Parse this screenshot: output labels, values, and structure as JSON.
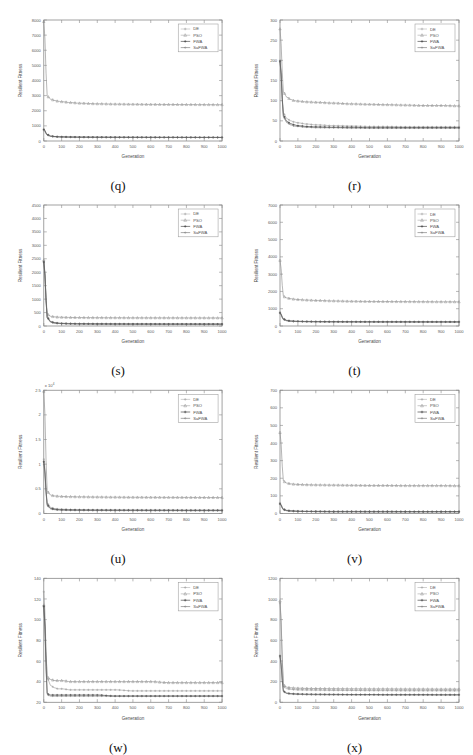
{
  "page": {
    "faint_header_text": "",
    "background": "#ffffff",
    "panel_count": 8
  },
  "common": {
    "xlabel": "Generation",
    "ylabel": "Resilient Fitness",
    "xticks": [
      0,
      100,
      200,
      300,
      400,
      500,
      600,
      700,
      800,
      900,
      1000
    ],
    "xlim": [
      0,
      1000
    ],
    "legend_position": "top-right",
    "legend_entries": [
      {
        "label": "DE",
        "marker": "plus",
        "color": "#9a9a9a"
      },
      {
        "label": "PSO",
        "marker": "triangle",
        "color": "#8e8e8e"
      },
      {
        "label": "FWA",
        "marker": "plus",
        "color": "#3a3a3a"
      },
      {
        "label": "SaFWA",
        "marker": "dot",
        "color": "#707070"
      }
    ],
    "series_names": [
      "DE",
      "PSO",
      "FWA",
      "SaFWA"
    ]
  },
  "chart_data": [
    {
      "id": "q",
      "caption": "(q)",
      "type": "line",
      "title": "",
      "xlabel": "Generation",
      "ylabel": "Resilient Fitness",
      "xlim": [
        0,
        1000
      ],
      "ylim": [
        0,
        8000
      ],
      "yticks": [
        0,
        1000,
        2000,
        3000,
        4000,
        5000,
        6000,
        7000,
        8000
      ],
      "ytick_labels": [
        "0",
        "1000",
        "2000",
        "3000",
        "4000",
        "5000",
        "6000",
        "7000",
        "8000"
      ],
      "y_exponent": "",
      "grid": false,
      "x": [
        0,
        20,
        40,
        60,
        80,
        100,
        150,
        200,
        300,
        400,
        500,
        600,
        700,
        800,
        900,
        1000
      ],
      "series": [
        {
          "name": "DE",
          "values": [
            780,
            430,
            330,
            300,
            285,
            275,
            265,
            258,
            252,
            248,
            245,
            243,
            241,
            240,
            239,
            238
          ]
        },
        {
          "name": "PSO",
          "values": [
            7900,
            2950,
            2760,
            2680,
            2630,
            2600,
            2540,
            2500,
            2460,
            2440,
            2430,
            2420,
            2415,
            2410,
            2405,
            2400
          ]
        },
        {
          "name": "FWA",
          "values": [
            760,
            410,
            320,
            295,
            282,
            272,
            262,
            256,
            250,
            246,
            244,
            242,
            240,
            239,
            238,
            237
          ]
        },
        {
          "name": "SaFWA",
          "values": [
            700,
            380,
            300,
            280,
            268,
            260,
            252,
            246,
            241,
            238,
            236,
            234,
            233,
            232,
            231,
            230
          ]
        }
      ]
    },
    {
      "id": "r",
      "caption": "(r)",
      "type": "line",
      "title": "",
      "xlabel": "Generation",
      "ylabel": "Resilient Fitness",
      "xlim": [
        0,
        1000
      ],
      "ylim": [
        0,
        300
      ],
      "yticks": [
        0,
        50,
        100,
        150,
        200,
        250,
        300
      ],
      "ytick_labels": [
        "0",
        "50",
        "100",
        "150",
        "200",
        "250",
        "300"
      ],
      "y_exponent": "",
      "grid": false,
      "x": [
        0,
        20,
        40,
        60,
        80,
        100,
        150,
        200,
        300,
        400,
        500,
        600,
        700,
        800,
        900,
        1000
      ],
      "series": [
        {
          "name": "DE",
          "values": [
            200,
            68,
            55,
            50,
            47,
            45,
            42,
            40,
            38,
            37,
            36,
            36,
            35,
            35,
            35,
            35
          ]
        },
        {
          "name": "PSO",
          "values": [
            278,
            120,
            108,
            103,
            100,
            99,
            97,
            96,
            94,
            92,
            91,
            90,
            89,
            88,
            88,
            87
          ]
        },
        {
          "name": "FWA",
          "values": [
            198,
            62,
            48,
            43,
            40,
            38,
            36,
            35,
            34,
            34,
            33,
            33,
            33,
            33,
            33,
            33
          ]
        },
        {
          "name": "SaFWA",
          "values": [
            196,
            58,
            45,
            40,
            37,
            36,
            34,
            33,
            33,
            32,
            32,
            32,
            32,
            32,
            32,
            32
          ]
        }
      ]
    },
    {
      "id": "s",
      "caption": "(s)",
      "type": "line",
      "title": "",
      "xlabel": "Generation",
      "ylabel": "Resilient Fitness",
      "xlim": [
        0,
        1000
      ],
      "ylim": [
        0,
        4500
      ],
      "yticks": [
        0,
        500,
        1000,
        1500,
        2000,
        2500,
        3000,
        3500,
        4000,
        4500
      ],
      "ytick_labels": [
        "0",
        "500",
        "1000",
        "1500",
        "2000",
        "2500",
        "3000",
        "3500",
        "4000",
        "4500"
      ],
      "y_exponent": "",
      "grid": false,
      "x": [
        0,
        20,
        40,
        60,
        80,
        100,
        150,
        200,
        300,
        400,
        500,
        600,
        700,
        800,
        900,
        1000
      ],
      "series": [
        {
          "name": "DE",
          "values": [
            2400,
            330,
            170,
            130,
            115,
            105,
            95,
            90,
            85,
            82,
            80,
            79,
            78,
            77,
            76,
            75
          ]
        },
        {
          "name": "PSO",
          "values": [
            2450,
            430,
            360,
            340,
            330,
            325,
            318,
            314,
            310,
            307,
            305,
            304,
            303,
            302,
            301,
            300
          ]
        },
        {
          "name": "FWA",
          "values": [
            2380,
            300,
            150,
            115,
            100,
            92,
            84,
            80,
            76,
            74,
            72,
            71,
            70,
            70,
            69,
            69
          ]
        },
        {
          "name": "SaFWA",
          "values": [
            2350,
            280,
            140,
            108,
            94,
            87,
            79,
            75,
            72,
            70,
            68,
            68,
            67,
            67,
            66,
            66
          ]
        }
      ]
    },
    {
      "id": "t",
      "caption": "(t)",
      "type": "line",
      "title": "",
      "xlabel": "Generation",
      "ylabel": "Resilient Fitness",
      "xlim": [
        0,
        1000
      ],
      "ylim": [
        0,
        7000
      ],
      "yticks": [
        0,
        1000,
        2000,
        3000,
        4000,
        5000,
        6000,
        7000
      ],
      "ytick_labels": [
        "0",
        "1000",
        "2000",
        "3000",
        "4000",
        "5000",
        "6000",
        "7000"
      ],
      "y_exponent": "",
      "grid": false,
      "x": [
        0,
        20,
        40,
        60,
        80,
        100,
        150,
        200,
        300,
        400,
        500,
        600,
        700,
        800,
        900,
        1000
      ],
      "series": [
        {
          "name": "DE",
          "values": [
            800,
            420,
            330,
            300,
            285,
            278,
            268,
            262,
            256,
            252,
            250,
            248,
            247,
            246,
            245,
            244
          ]
        },
        {
          "name": "PSO",
          "values": [
            3800,
            1700,
            1620,
            1580,
            1550,
            1530,
            1500,
            1480,
            1450,
            1430,
            1420,
            1415,
            1410,
            1405,
            1400,
            1398
          ]
        },
        {
          "name": "FWA",
          "values": [
            760,
            390,
            310,
            285,
            272,
            265,
            256,
            250,
            245,
            242,
            240,
            239,
            238,
            237,
            236,
            236
          ]
        },
        {
          "name": "SaFWA",
          "values": [
            720,
            360,
            295,
            272,
            260,
            254,
            246,
            241,
            237,
            234,
            232,
            231,
            230,
            229,
            229,
            228
          ]
        }
      ]
    },
    {
      "id": "u",
      "caption": "(u)",
      "type": "line",
      "title": "",
      "xlabel": "Generation",
      "ylabel": "Resilient Fitness",
      "xlim": [
        0,
        1000
      ],
      "ylim": [
        0,
        2.5
      ],
      "yticks": [
        0,
        0.5,
        1,
        1.5,
        2,
        2.5
      ],
      "ytick_labels": [
        "0",
        "0.5",
        "1",
        "1.5",
        "2",
        "2.5"
      ],
      "y_exponent": "x 10^4",
      "grid": false,
      "x": [
        0,
        20,
        40,
        60,
        80,
        100,
        150,
        200,
        300,
        400,
        500,
        600,
        700,
        800,
        900,
        1000
      ],
      "series": [
        {
          "name": "DE",
          "values": [
            1.1,
            0.2,
            0.12,
            0.1,
            0.09,
            0.085,
            0.08,
            0.078,
            0.075,
            0.073,
            0.072,
            0.071,
            0.07,
            0.07,
            0.069,
            0.069
          ]
        },
        {
          "name": "PSO",
          "values": [
            2.48,
            0.44,
            0.37,
            0.355,
            0.35,
            0.345,
            0.34,
            0.337,
            0.333,
            0.33,
            0.328,
            0.327,
            0.326,
            0.325,
            0.324,
            0.323
          ]
        },
        {
          "name": "FWA",
          "values": [
            1.05,
            0.17,
            0.1,
            0.085,
            0.078,
            0.074,
            0.07,
            0.068,
            0.066,
            0.065,
            0.064,
            0.063,
            0.063,
            0.062,
            0.062,
            0.062
          ]
        },
        {
          "name": "SaFWA",
          "values": [
            1.0,
            0.15,
            0.09,
            0.076,
            0.07,
            0.067,
            0.063,
            0.061,
            0.059,
            0.058,
            0.058,
            0.057,
            0.057,
            0.056,
            0.056,
            0.056
          ]
        }
      ]
    },
    {
      "id": "v",
      "caption": "(v)",
      "type": "line",
      "title": "",
      "xlabel": "Generation",
      "ylabel": "Resilient Fitness",
      "xlim": [
        0,
        1000
      ],
      "ylim": [
        0,
        700
      ],
      "yticks": [
        0,
        100,
        200,
        300,
        400,
        500,
        600,
        700
      ],
      "ytick_labels": [
        "0",
        "100",
        "200",
        "300",
        "400",
        "500",
        "600",
        "700"
      ],
      "y_exponent": "",
      "grid": false,
      "x": [
        0,
        20,
        40,
        60,
        80,
        100,
        150,
        200,
        300,
        400,
        500,
        600,
        700,
        800,
        900,
        1000
      ],
      "series": [
        {
          "name": "DE",
          "values": [
            60,
            25,
            18,
            16,
            15,
            14,
            13,
            13,
            12,
            12,
            12,
            12,
            11,
            11,
            11,
            11
          ]
        },
        {
          "name": "PSO",
          "values": [
            460,
            182,
            172,
            168,
            166,
            165,
            163,
            162,
            161,
            160,
            159,
            159,
            158,
            158,
            158,
            157
          ]
        },
        {
          "name": "FWA",
          "values": [
            55,
            22,
            16,
            14,
            13,
            12,
            11,
            11,
            10,
            10,
            10,
            10,
            10,
            10,
            10,
            10
          ]
        },
        {
          "name": "SaFWA",
          "values": [
            52,
            20,
            15,
            13,
            12,
            11,
            11,
            10,
            10,
            10,
            9,
            9,
            9,
            9,
            9,
            9
          ]
        }
      ]
    },
    {
      "id": "w",
      "caption": "(w)",
      "type": "line",
      "title": "",
      "xlabel": "Generation",
      "ylabel": "Resilient Fitness",
      "xlim": [
        0,
        1000
      ],
      "ylim": [
        20,
        140
      ],
      "yticks": [
        20,
        40,
        60,
        80,
        100,
        120,
        140
      ],
      "ytick_labels": [
        "20",
        "40",
        "60",
        "80",
        "100",
        "120",
        "140"
      ],
      "y_exponent": "",
      "grid": false,
      "x": [
        0,
        20,
        40,
        60,
        80,
        100,
        150,
        200,
        300,
        400,
        500,
        600,
        700,
        800,
        900,
        1000
      ],
      "series": [
        {
          "name": "DE",
          "values": [
            127,
            43,
            36,
            34,
            33,
            33,
            32,
            32,
            32,
            32,
            31,
            31,
            31,
            31,
            31,
            31
          ]
        },
        {
          "name": "PSO",
          "values": [
            114,
            44,
            42,
            41,
            41,
            41,
            40,
            40,
            40,
            40,
            40,
            40,
            39,
            39,
            39,
            39
          ]
        },
        {
          "name": "FWA",
          "values": [
            113,
            28,
            27,
            27,
            27,
            27,
            27,
            27,
            27,
            26,
            26,
            26,
            26,
            26,
            26,
            26
          ]
        },
        {
          "name": "SaFWA",
          "values": [
            112,
            27,
            26,
            26,
            26,
            26,
            26,
            26,
            26,
            26,
            26,
            26,
            26,
            26,
            26,
            26
          ]
        }
      ]
    },
    {
      "id": "x",
      "caption": "(x)",
      "type": "line",
      "title": "",
      "xlabel": "Generation",
      "ylabel": "Resilient Fitness",
      "xlim": [
        0,
        1000
      ],
      "ylim": [
        0,
        1200
      ],
      "yticks": [
        0,
        200,
        400,
        600,
        800,
        1000,
        1200
      ],
      "ytick_labels": [
        "0",
        "200",
        "400",
        "600",
        "800",
        "1000",
        "1200"
      ],
      "y_exponent": "",
      "grid": false,
      "x": [
        0,
        20,
        40,
        60,
        80,
        100,
        150,
        200,
        300,
        400,
        500,
        600,
        700,
        800,
        900,
        1000
      ],
      "series": [
        {
          "name": "DE",
          "values": [
            960,
            150,
            130,
            125,
            122,
            120,
            118,
            117,
            115,
            114,
            113,
            113,
            112,
            112,
            112,
            111
          ]
        },
        {
          "name": "PSO",
          "values": [
            980,
            165,
            145,
            140,
            138,
            136,
            134,
            133,
            131,
            130,
            129,
            129,
            128,
            128,
            127,
            127
          ]
        },
        {
          "name": "FWA",
          "values": [
            450,
            105,
            88,
            84,
            82,
            80,
            78,
            77,
            76,
            75,
            75,
            74,
            74,
            74,
            73,
            73
          ]
        },
        {
          "name": "SaFWA",
          "values": [
            440,
            100,
            84,
            80,
            78,
            76,
            74,
            73,
            72,
            71,
            71,
            70,
            70,
            70,
            70,
            70
          ]
        }
      ]
    }
  ]
}
